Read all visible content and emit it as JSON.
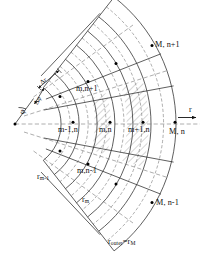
{
  "figure": {
    "type": "diagram"
  },
  "axes": {
    "radial_axis_label": "r",
    "angle_label": "φ"
  },
  "spacing_labels": {
    "dr": "Δr",
    "dphi": "Δφ"
  },
  "node_labels": [
    {
      "id": "M-n-plus-1",
      "text": "M, n+1"
    },
    {
      "id": "m-n-plus-1",
      "text": "m,n+1"
    },
    {
      "id": "m-minus-1-n",
      "text": "m-1,n"
    },
    {
      "id": "m-n",
      "text": "m,n"
    },
    {
      "id": "m-plus-1-n",
      "text": "m+1,n"
    },
    {
      "id": "M-n",
      "text": "M, n"
    },
    {
      "id": "m-n-minus-1",
      "text": "m,n-1"
    },
    {
      "id": "M-n-minus-1",
      "text": "M, n-1"
    }
  ],
  "radius_labels": [
    {
      "id": "r-m-minus-1",
      "base": "r",
      "sub": "m-1"
    },
    {
      "id": "r-m",
      "base": "r",
      "sub": "m"
    },
    {
      "id": "r-outer",
      "base": "r",
      "sub": "outer",
      "tail": "=r",
      "tail_sub": "M"
    }
  ],
  "colors": {
    "line": "#222222",
    "dashed": "#555555",
    "hatch": "#777777",
    "background": "#ffffff",
    "node": "#000000"
  },
  "geometry": {
    "apex_x": 15,
    "apex_y": 124,
    "half_angle_deg": 52,
    "arc_radii": [
      46,
      64,
      82,
      100,
      118,
      136,
      161
    ],
    "center_row_nodes_x": [
      73,
      110,
      143,
      175
    ]
  }
}
